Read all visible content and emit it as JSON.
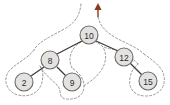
{
  "diagram": {
    "type": "binary-tree",
    "background_color": "#ffffff",
    "nodes": [
      {
        "id": "n10",
        "label": "10",
        "cx": 89,
        "cy": 35,
        "r": 9
      },
      {
        "id": "n8",
        "label": "8",
        "cx": 50,
        "cy": 60,
        "r": 9
      },
      {
        "id": "n12",
        "label": "12",
        "cx": 124,
        "cy": 57,
        "r": 9
      },
      {
        "id": "n2",
        "label": "2",
        "cx": 24,
        "cy": 82,
        "r": 9
      },
      {
        "id": "n9",
        "label": "9",
        "cx": 72,
        "cy": 82,
        "r": 9
      },
      {
        "id": "n15",
        "label": "15",
        "cx": 148,
        "cy": 81,
        "r": 9
      }
    ],
    "edges": [
      {
        "from": "n10",
        "to": "n8",
        "x1": 82,
        "y1": 41,
        "x2": 57,
        "y2": 54
      },
      {
        "from": "n10",
        "to": "n12",
        "x1": 96,
        "y1": 41,
        "x2": 118,
        "y2": 51
      },
      {
        "from": "n8",
        "to": "n2",
        "x1": 44,
        "y1": 67,
        "x2": 31,
        "y2": 76
      },
      {
        "from": "n8",
        "to": "n9",
        "x1": 57,
        "y1": 67,
        "x2": 66,
        "y2": 76
      },
      {
        "from": "n12",
        "to": "n15",
        "x1": 130,
        "y1": 63,
        "x2": 142,
        "y2": 75
      }
    ],
    "node_fill_color": "#e4e2e0",
    "node_stroke_color": "#6e6c6a",
    "edge_color": "#3a3836",
    "contour_color": "#9a9896",
    "contour_style": "dashed",
    "arrow": {
      "name": "entry-arrow",
      "color": "#8a3a1e",
      "direction": "up",
      "x": 98,
      "y_tip": 4,
      "y_base": 17
    }
  }
}
